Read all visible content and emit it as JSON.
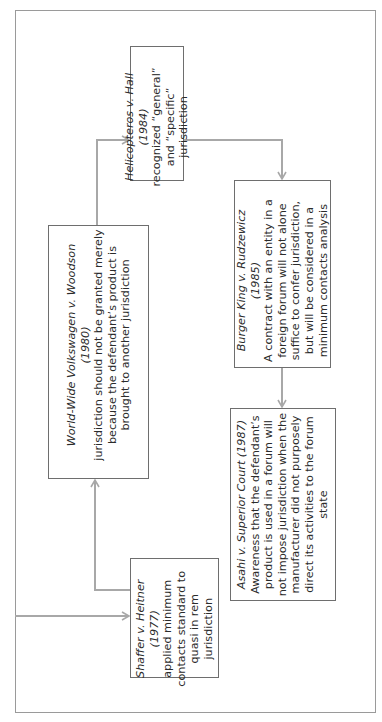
{
  "diagram": {
    "orientation": "rotated-90-ccw",
    "colors": {
      "box_border": "#6e6e6e",
      "connector": "#a8a8a8",
      "frame": "#9a9a9a",
      "text": "#2b2b2b"
    },
    "nodes": [
      {
        "id": "shaffer",
        "title": "Shaffer v. Heitner (1977)",
        "body": "applied minimum contacts standard to quasi in rem jurisdiction"
      },
      {
        "id": "worldwide",
        "title": "World-Wide Volkswagen v. Woodson (1980)",
        "body": "jurisdiction should not be granted merely because the defendant’s product is brought to another jurisdiction"
      },
      {
        "id": "helicopteros",
        "title": "Helicopteros v. Hall (1984)",
        "body": "recognized “general” and “specific” jurisdiction"
      },
      {
        "id": "burgerking",
        "title": "Burger King v. Rudzewicz (1985)",
        "body": "A contract with an entity in a foreign forum will not alone suffice to confer jurisdiction, but will be considered in a minimum contacts analysis"
      },
      {
        "id": "asahi",
        "title": "Asahi v. Superior Court (1987)",
        "body": "Awareness that the defendant’s product is used in a forum will not impose jurisdiction when the manufacturer did not purposely direct its activities to the forum state"
      }
    ],
    "edges": [
      {
        "from": "entry",
        "to": "shaffer"
      },
      {
        "from": "shaffer",
        "to": "worldwide"
      },
      {
        "from": "worldwide",
        "to": "helicopteros"
      },
      {
        "from": "helicopteros",
        "to": "burgerking"
      },
      {
        "from": "burgerking",
        "to": "asahi"
      }
    ]
  }
}
